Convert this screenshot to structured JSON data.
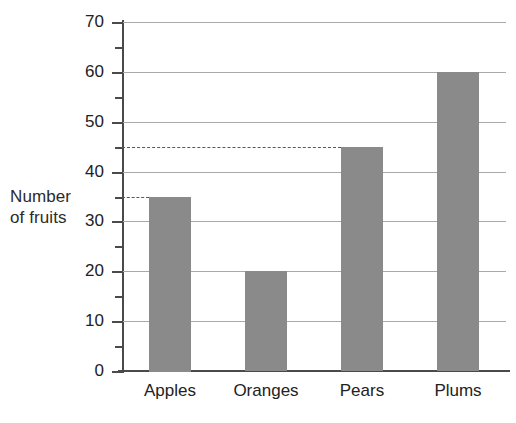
{
  "chart_data": {
    "type": "bar",
    "title": "",
    "xlabel": "",
    "ylabel": "Number\nof fruits",
    "ylabel_lines": [
      "Number",
      "of fruits"
    ],
    "categories": [
      "Apples",
      "Oranges",
      "Pears",
      "Plums"
    ],
    "values": [
      35,
      20,
      45,
      60
    ],
    "ylim": [
      0,
      70
    ],
    "y_major_ticks": [
      0,
      10,
      20,
      30,
      40,
      50,
      60,
      70
    ],
    "y_minor_ticks": [
      5,
      15,
      25,
      35,
      45,
      55,
      65
    ],
    "y_tick_labels": [
      "0",
      "10",
      "20",
      "30",
      "40",
      "50",
      "60",
      "70"
    ],
    "grid": "horizontal-major",
    "legend": "none",
    "annotations": [
      {
        "type": "dashed-reference-line",
        "value": 35,
        "to_category": "Apples"
      },
      {
        "type": "dashed-reference-line",
        "value": 45,
        "to_category": "Pears"
      }
    ],
    "colors": {
      "bar_fill": "#8a8a8a",
      "gridline": "#a9a9a9",
      "axis": "#4a4a4a",
      "dashed": "#585858",
      "background": "#ffffff",
      "text": "#222222"
    }
  }
}
